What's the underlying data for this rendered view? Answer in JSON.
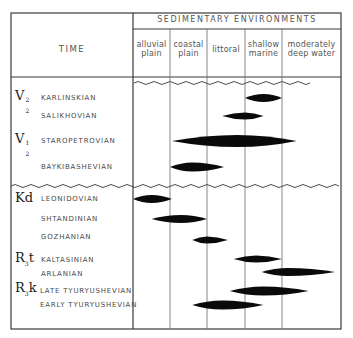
{
  "header": {
    "time_label": "TIME",
    "environments_label": "SEDIMENTARY ENVIRONMENTS",
    "columns": [
      {
        "line1": "alluvial",
        "line2": "plain"
      },
      {
        "line1": "coastal",
        "line2": "plain"
      },
      {
        "line1": "littoral",
        "line2": ""
      },
      {
        "line1": "shallow",
        "line2": "marine"
      },
      {
        "line1": "moderately",
        "line2": "deep water"
      }
    ]
  },
  "groups": [
    {
      "symbol": "V",
      "sup": "2",
      "sub": "2"
    },
    {
      "symbol": "V",
      "sup": "1",
      "sub": "2"
    },
    {
      "symbol": "Kd",
      "sup": "",
      "sub": ""
    },
    {
      "symbol": "R",
      "sup": "",
      "sub": "3",
      "suffix": "t"
    },
    {
      "symbol": "R",
      "sup": "",
      "sub": "3",
      "suffix": "k"
    }
  ],
  "stages": [
    {
      "name": "KARLINSKIAN"
    },
    {
      "name": "SALIKHOVIAN"
    },
    {
      "name": "STAROPETROVIAN"
    },
    {
      "name": "BAYKIBASHEVIAN"
    },
    {
      "name": "LEONIDOVIAN"
    },
    {
      "name": "SHTANDINIAN"
    },
    {
      "name": "GOZHANIAN"
    },
    {
      "name": "KALTASINIAN"
    },
    {
      "name": "ARLANIAN"
    },
    {
      "name": "LATE TYURYUSHEVIAN"
    },
    {
      "name": "EARLY TYURYUSHEVIAN"
    }
  ],
  "chart_data": {
    "type": "range-lens",
    "title": "SEDIMENTARY ENVIRONMENTS",
    "xlabel": "Sedimentary environment",
    "ylabel": "TIME",
    "categories": [
      "alluvial plain",
      "coastal plain",
      "littoral",
      "shallow marine",
      "moderately deep water"
    ],
    "unconformities_after": [
      "(top of section)",
      "BAYKIBASHEVIAN"
    ],
    "series": [
      {
        "stage": "KARLINSKIAN",
        "group": "V2^2",
        "from": 3.0,
        "to": 4.0,
        "peak": 3.5
      },
      {
        "stage": "SALIKHOVIAN",
        "group": "V2^2",
        "from": 2.4,
        "to": 3.5,
        "peak": 3.0
      },
      {
        "stage": "STAROPETROVIAN",
        "group": "V2^1",
        "from": 1.05,
        "to": 4.25,
        "peak": 2.8
      },
      {
        "stage": "BAYKIBASHEVIAN",
        "group": "V2^1",
        "from": 1.0,
        "to": 2.45,
        "peak": 1.6
      },
      {
        "stage": "LEONIDOVIAN",
        "group": "Kd",
        "from": 0.0,
        "to": 1.05,
        "peak": 0.5
      },
      {
        "stage": "SHTANDINIAN",
        "group": "Kd",
        "from": 0.5,
        "to": 2.0,
        "peak": 1.3
      },
      {
        "stage": "GOZHANIAN",
        "group": "Kd",
        "from": 1.6,
        "to": 2.55,
        "peak": 2.0
      },
      {
        "stage": "KALTASINIAN",
        "group": "R3t",
        "from": 2.7,
        "to": 4.0,
        "peak": 3.3
      },
      {
        "stage": "ARLANIAN",
        "group": "R3t",
        "from": 3.45,
        "to": 4.9,
        "peak": 4.1
      },
      {
        "stage": "LATE TYURYUSHEVIAN",
        "group": "R3k",
        "from": 2.6,
        "to": 4.45,
        "peak": 3.5
      },
      {
        "stage": "EARLY TYURYUSHEVIAN",
        "group": "R3k",
        "from": 1.6,
        "to": 3.5,
        "peak": 2.4
      }
    ]
  },
  "colors": {
    "line": "#3a3a3a",
    "lens": "#0a0a0a",
    "text": "#4a4a4a",
    "background": "#ffffff"
  }
}
